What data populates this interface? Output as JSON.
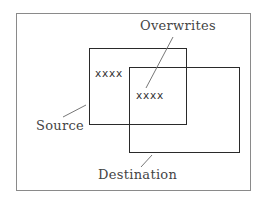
{
  "diagram": {
    "labels": {
      "overwrites": "Overwrites",
      "source": "Source",
      "destination": "Destination"
    },
    "box_contents": {
      "source": "xxxx",
      "overlap": "xxxx"
    },
    "colors": {
      "frame": "#8a8a8a",
      "box_border": "#2a2a2a",
      "leader_line": "#777777",
      "text": "#444444"
    }
  }
}
